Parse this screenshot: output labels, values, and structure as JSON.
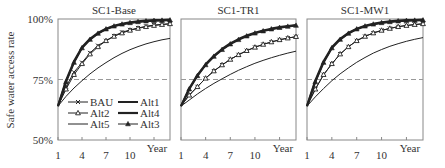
{
  "chart_data": {
    "type": "line",
    "ylabel": "Safe water access rate",
    "xlabel": "Year",
    "x": [
      1,
      2,
      3,
      4,
      5,
      6,
      7,
      8,
      9,
      10,
      11,
      12,
      13,
      14,
      15
    ],
    "xticks": [
      1,
      4,
      7,
      10
    ],
    "yticks": [
      {
        "value": 50,
        "label": "50%"
      },
      {
        "value": 75,
        "label": "75%"
      },
      {
        "value": 100,
        "label": "100%"
      }
    ],
    "ylim": [
      50,
      100
    ],
    "xlim": [
      1,
      15
    ],
    "reference_line": {
      "value": 75,
      "style": "dashed"
    },
    "legend": {
      "position": "inside-bottom-left of first panel",
      "entries": [
        "BAU",
        "Alt1",
        "Alt2",
        "Alt4",
        "Alt5",
        "Alt3"
      ]
    },
    "panels": [
      {
        "title": "SC1-Base",
        "series": [
          {
            "name": "BAU",
            "marker": "x",
            "values": [
              64,
              72,
              78,
              82,
              86,
              89,
              91,
              93,
              94.5,
              95.5,
              96.3,
              97,
              97.5,
              97.8,
              98
            ]
          },
          {
            "name": "Alt1",
            "marker": "none",
            "width": 2,
            "values": [
              64,
              74,
              82,
              88,
              91.5,
              94,
              95.8,
              97,
              97.8,
              98.4,
              98.8,
              99.1,
              99.3,
              99.4,
              99.5
            ]
          },
          {
            "name": "Alt2",
            "marker": "triangle-open",
            "values": [
              64,
              71,
              77,
              81.5,
              85.5,
              88.5,
              91,
              92.8,
              94.2,
              95.3,
              96.1,
              96.8,
              97.3,
              97.7,
              98
            ]
          },
          {
            "name": "Alt4",
            "marker": "none",
            "width": 2.2,
            "values": [
              64,
              74.5,
              82.5,
              88.3,
              91.8,
              94.2,
              96,
              97.2,
              98,
              98.6,
              99,
              99.3,
              99.5,
              99.6,
              99.7
            ]
          },
          {
            "name": "Alt5",
            "marker": "none",
            "width": 1,
            "values": [
              64,
              68,
              71.5,
              74.5,
              77.3,
              79.8,
              82,
              84,
              85.8,
              87.3,
              88.6,
              89.7,
              90.6,
              91.4,
              92
            ]
          },
          {
            "name": "Alt3",
            "marker": "triangle-filled",
            "values": [
              64,
              74,
              82,
              88,
              91.5,
              94,
              95.8,
              97,
              97.8,
              98.4,
              98.8,
              99.1,
              99.3,
              99.4,
              99.5
            ]
          }
        ]
      },
      {
        "title": "SC1-TR1",
        "series": [
          {
            "name": "BAU",
            "marker": "x",
            "values": [
              64,
              68.5,
              72,
              75.5,
              78.5,
              81,
              83.3,
              85.2,
              86.9,
              88.3,
              89.5,
              90.5,
              91.4,
              92.1,
              92.7
            ]
          },
          {
            "name": "Alt1",
            "marker": "none",
            "width": 2,
            "values": [
              64,
              71,
              76.5,
              81,
              84.5,
              87.3,
              89.6,
              91.4,
              92.9,
              94.1,
              95,
              95.8,
              96.4,
              96.9,
              97.3
            ]
          },
          {
            "name": "Alt2",
            "marker": "triangle-open",
            "values": [
              64,
              68.5,
              72,
              75.5,
              78.5,
              81,
              83.3,
              85.2,
              86.9,
              88.3,
              89.5,
              90.5,
              91.4,
              92.1,
              92.7
            ]
          },
          {
            "name": "Alt4",
            "marker": "none",
            "width": 2.2,
            "values": [
              64,
              71.3,
              76.8,
              81.3,
              84.8,
              87.6,
              89.9,
              91.7,
              93.2,
              94.3,
              95.2,
              96,
              96.6,
              97.1,
              97.5
            ]
          },
          {
            "name": "Alt5",
            "marker": "none",
            "width": 1,
            "values": [
              64,
              66.5,
              69,
              71.3,
              73.4,
              75.3,
              77.1,
              78.8,
              80.3,
              81.7,
              82.9,
              84,
              85,
              85.9,
              86.7
            ]
          },
          {
            "name": "Alt3",
            "marker": "triangle-filled",
            "values": [
              64,
              71,
              76.5,
              81,
              84.5,
              87.3,
              89.6,
              91.4,
              92.9,
              94.1,
              95,
              95.8,
              96.4,
              96.9,
              97.3
            ]
          }
        ]
      },
      {
        "title": "SC1-MW1",
        "series": [
          {
            "name": "BAU",
            "marker": "x",
            "values": [
              64,
              71,
              77,
              81.5,
              85.5,
              88.5,
              91,
              92.8,
              94.2,
              95.3,
              96.1,
              96.8,
              97.3,
              97.7,
              98
            ]
          },
          {
            "name": "Alt1",
            "marker": "none",
            "width": 2,
            "values": [
              64,
              74,
              82,
              88,
              91.5,
              94,
              95.8,
              97,
              97.8,
              98.4,
              98.8,
              99.1,
              99.3,
              99.4,
              99.5
            ]
          },
          {
            "name": "Alt2",
            "marker": "triangle-open",
            "values": [
              64,
              71,
              77,
              81.5,
              85.5,
              88.5,
              91,
              92.8,
              94.2,
              95.3,
              96.1,
              96.8,
              97.3,
              97.7,
              98
            ]
          },
          {
            "name": "Alt4",
            "marker": "none",
            "width": 2.2,
            "values": [
              64,
              74.5,
              82.5,
              88.3,
              91.8,
              94.2,
              96,
              97.2,
              98,
              98.6,
              99,
              99.3,
              99.5,
              99.6,
              99.7
            ]
          },
          {
            "name": "Alt5",
            "marker": "none",
            "width": 1,
            "values": [
              64,
              67.8,
              71.3,
              74.5,
              77.3,
              79.8,
              82.1,
              84.1,
              85.9,
              87.4,
              88.7,
              89.8,
              90.8,
              91.6,
              92.3
            ]
          },
          {
            "name": "Alt3",
            "marker": "triangle-filled",
            "values": [
              64,
              74,
              82,
              88,
              91.5,
              94,
              95.8,
              97,
              97.8,
              98.4,
              98.8,
              99.1,
              99.3,
              99.4,
              99.5
            ]
          }
        ]
      }
    ],
    "colors": {
      "lines": "#222222",
      "axis": "#888888",
      "dashed": "#999999"
    }
  }
}
